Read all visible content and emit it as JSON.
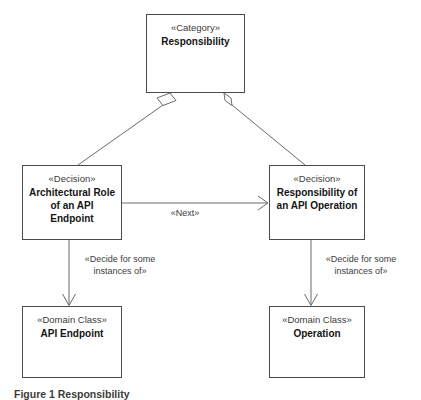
{
  "diagram": {
    "type": "uml-class-diagram",
    "background_color": "#ffffff",
    "line_color": "#4a4a4a",
    "nodes": [
      {
        "id": "responsibility",
        "stereotype": "«Category»",
        "name": "Responsibility",
        "x": 146,
        "y": 14,
        "w": 99,
        "h": 79
      },
      {
        "id": "arch-role",
        "stereotype": "«Decision»",
        "name": "Architectural Role of an API Endpoint",
        "x": 22,
        "y": 165,
        "w": 100,
        "h": 75
      },
      {
        "id": "resp-operation",
        "stereotype": "«Decision»",
        "name": "Responsibility of an API Operation",
        "x": 269,
        "y": 165,
        "w": 96,
        "h": 75
      },
      {
        "id": "api-endpoint",
        "stereotype": "«Domain Class»",
        "name": "API Endpoint",
        "x": 22,
        "y": 306,
        "w": 100,
        "h": 72
      },
      {
        "id": "operation",
        "stereotype": "«Domain Class»",
        "name": "Operation",
        "x": 269,
        "y": 306,
        "w": 96,
        "h": 72
      }
    ],
    "edges": [
      {
        "id": "resp-to-arch-role",
        "from": "responsibility",
        "to": "arch-role",
        "relation": "aggregation",
        "label": ""
      },
      {
        "id": "resp-to-resp-operation",
        "from": "responsibility",
        "to": "resp-operation",
        "relation": "aggregation",
        "label": ""
      },
      {
        "id": "arch-role-to-resp-operation",
        "from": "arch-role",
        "to": "resp-operation",
        "relation": "association",
        "label": "«Next»"
      },
      {
        "id": "arch-role-to-api-endpoint",
        "from": "arch-role",
        "to": "api-endpoint",
        "relation": "association",
        "label": "«Decide for some\ninstances of»"
      },
      {
        "id": "resp-operation-to-operation",
        "from": "resp-operation",
        "to": "operation",
        "relation": "association",
        "label": "«Decide for some\ninstances of»"
      }
    ]
  },
  "caption": "Figure 1 Responsibility"
}
